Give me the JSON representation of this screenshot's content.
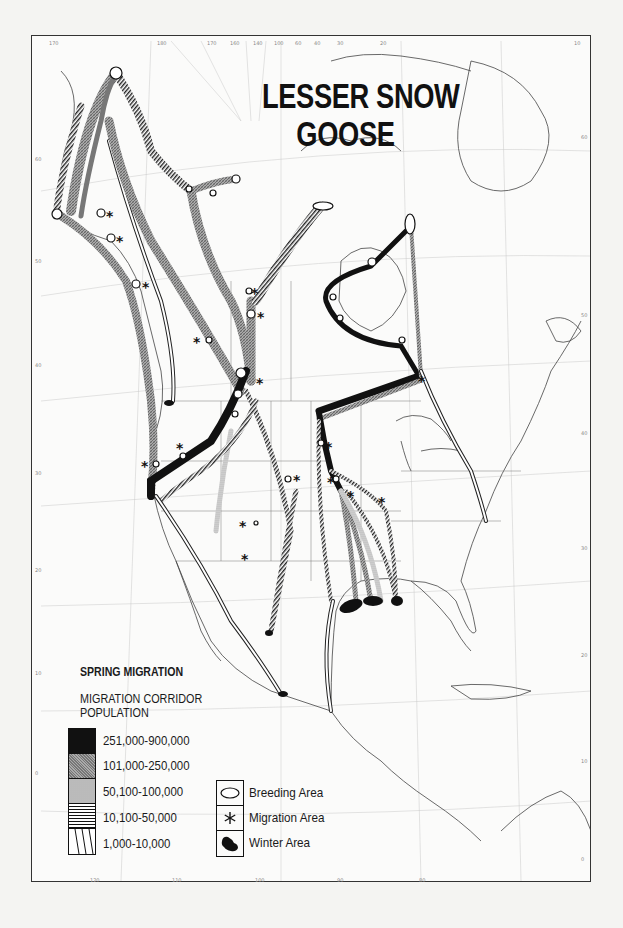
{
  "map": {
    "title_line1": "LESSER SNOW",
    "title_line2": "GOOSE",
    "season": "SPRING MIGRATION",
    "legend": {
      "corridor_heading_line1": "MIGRATION CORRIDOR",
      "corridor_heading_line2": "POPULATION",
      "population_classes": [
        {
          "label": "251,000-900,000",
          "pattern": "solid-black"
        },
        {
          "label": "101,000-250,000",
          "pattern": "dense-gray-crosshatch"
        },
        {
          "label": "50,100-100,000",
          "pattern": "stipple-dots"
        },
        {
          "label": "10,100-50,000",
          "pattern": "horizontal-lines"
        },
        {
          "label": "1,000-10,000",
          "pattern": "open-diagonal-lines"
        }
      ],
      "area_symbols": [
        {
          "label": "Breeding Area",
          "icon": "ellipse-outline-icon"
        },
        {
          "label": "Migration Area",
          "icon": "asterisk-icon"
        },
        {
          "label": "Winter Area",
          "icon": "black-blob-icon"
        }
      ]
    },
    "graticule": {
      "top_longitudes": [
        "170",
        "180",
        "170",
        "160",
        "140",
        "100",
        "60",
        "40",
        "30",
        "20",
        "10"
      ],
      "bottom_longitudes": [
        "120",
        "110",
        "100",
        "90",
        "80"
      ],
      "left_latitudes": [
        "60",
        "50",
        "40",
        "30",
        "20",
        "10",
        "0"
      ],
      "right_latitudes": [
        "60",
        "50",
        "40",
        "30",
        "20",
        "10",
        "0"
      ]
    },
    "colors": {
      "ink": "#111111",
      "paper": "#fbfbfa",
      "coastline": "#555555",
      "corridor_gray": "#8a8a8a"
    }
  }
}
